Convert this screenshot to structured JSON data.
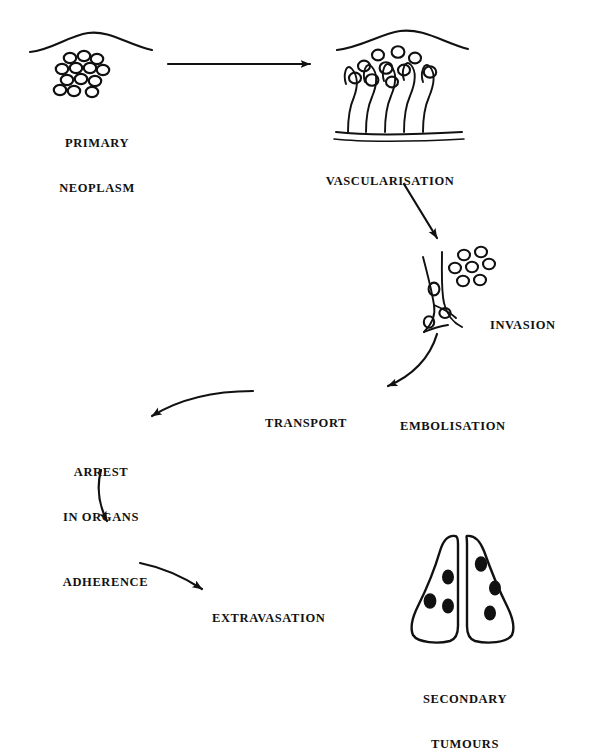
{
  "figure": {
    "type": "flow-diagram",
    "background_color": "#ffffff",
    "ink_color": "#111111"
  },
  "stages": [
    {
      "id": "primary-neoplasm",
      "label": "PRIMARY\nNEOPLASM",
      "line1": "PRIMARY",
      "line2": "NEOPLASM",
      "x": 22,
      "y": 106,
      "width": 150
    },
    {
      "id": "vascularisation",
      "label": "VASCULARISATION",
      "line1": "VASCULARISATION",
      "line2": "",
      "x": 300,
      "y": 144,
      "width": 180
    },
    {
      "id": "invasion",
      "label": "INVASION",
      "line1": "INVASION",
      "line2": "",
      "x": 490,
      "y": 288,
      "width": 105
    },
    {
      "id": "transport",
      "label": "TRANSPORT",
      "line1": "TRANSPORT",
      "line2": "",
      "x": 265,
      "y": 386,
      "width": 115
    },
    {
      "id": "embolisation",
      "label": "EMBOLISATION",
      "line1": "EMBOLISATION",
      "line2": "",
      "x": 400,
      "y": 389,
      "width": 140
    },
    {
      "id": "arrest-in-organs",
      "label": "ARREST\nIN ORGANS",
      "line1": "ARREST",
      "line2": "IN ORGANS",
      "x": 75,
      "y": 435,
      "width": 110
    },
    {
      "id": "adherence",
      "label": "ADHERENCE",
      "line1": "ADHERENCE",
      "line2": "",
      "x": 78,
      "y": 545,
      "width": 115
    },
    {
      "id": "extravasation",
      "label": "EXTRAVASATION",
      "line1": "EXTRAVASATION",
      "line2": "",
      "x": 212,
      "y": 581,
      "width": 150
    },
    {
      "id": "secondary-tumours",
      "label": "SECONDARY\nTUMOURS",
      "line1": "SECONDARY",
      "line2": "TUMOURS",
      "x": 400,
      "y": 662,
      "width": 130
    }
  ],
  "illustrations": [
    {
      "id": "primary-neoplasm-illustration",
      "name": "tumour-cell-cluster-under-tissue-surface",
      "cell_count": 12,
      "has_tissue_surface_curve": true
    },
    {
      "id": "vascularisation-illustration",
      "name": "tissue-with-blood-vessel-loops-and-cells",
      "vessel_loop_count": 3,
      "cell_count": 10,
      "has_tissue_surface_curve": true,
      "has_basement_membrane_line": true
    },
    {
      "id": "invasion-illustration",
      "name": "cells-entering-blood-vessel",
      "cell_count_outside": 7,
      "cell_count_inside_vessel": 3
    },
    {
      "id": "secondary-tumours-illustration",
      "name": "lungs-with-metastatic-nodules",
      "lobe_count": 2,
      "nodule_count": 6,
      "nodules_left_lobe": 3,
      "nodules_right_lobe": 3
    }
  ],
  "arrows": [
    {
      "id": "arrow-primary-to-vascularisation",
      "from": "primary-neoplasm",
      "to": "vascularisation",
      "style": "straight"
    },
    {
      "id": "arrow-vascularisation-to-invasion",
      "from": "vascularisation",
      "to": "invasion",
      "style": "straight-diagonal"
    },
    {
      "id": "arrow-invasion-to-transport",
      "from": "invasion",
      "to": "transport",
      "style": "curved"
    },
    {
      "id": "arrow-transport-to-arrest",
      "from": "transport",
      "to": "arrest-in-organs",
      "style": "curved"
    },
    {
      "id": "arrow-arrest-to-adherence",
      "from": "arrest-in-organs",
      "to": "adherence",
      "style": "curved"
    },
    {
      "id": "arrow-adherence-to-extravasation",
      "from": "adherence",
      "to": "extravasation",
      "style": "curved"
    }
  ]
}
